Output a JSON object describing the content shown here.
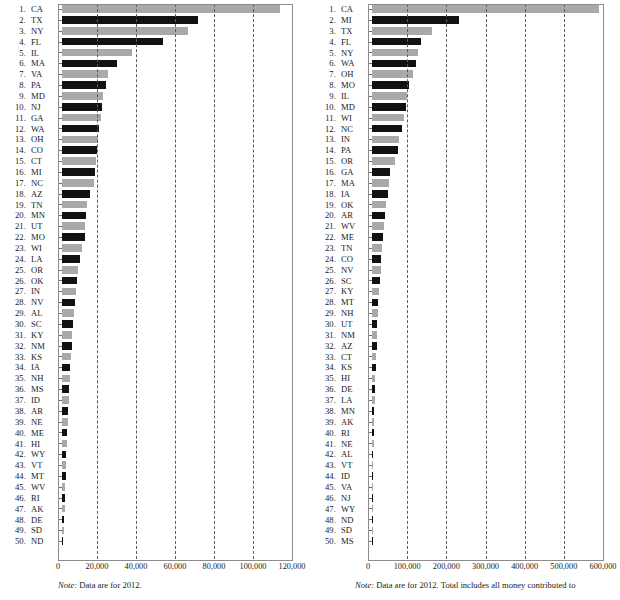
{
  "charts": [
    {
      "id": "left-chart",
      "note_prefix": "Note:",
      "note_text": " Data are for 2012.",
      "chart_data": {
        "type": "bar",
        "orientation": "horizontal",
        "title": "",
        "xlabel": "",
        "ylabel": "",
        "xlim": [
          0,
          120000
        ],
        "grid": true,
        "legend": false,
        "ticks": [
          "0",
          "20,000",
          "40,000",
          "60,000",
          "80,000",
          "100,000",
          "120,000"
        ],
        "tick_values": [
          0,
          20000,
          40000,
          60000,
          80000,
          100000,
          120000
        ],
        "categories": [
          "CA",
          "TX",
          "NY",
          "FL",
          "IL",
          "MA",
          "VA",
          "PA",
          "MD",
          "NJ",
          "GA",
          "WA",
          "OH",
          "CO",
          "CT",
          "MI",
          "NC",
          "AZ",
          "TN",
          "MN",
          "UT",
          "MO",
          "WI",
          "LA",
          "OR",
          "OK",
          "IN",
          "NV",
          "AL",
          "SC",
          "KY",
          "NM",
          "KS",
          "IA",
          "NH",
          "MS",
          "ID",
          "AR",
          "NE",
          "ME",
          "HI",
          "WY",
          "VT",
          "MT",
          "WV",
          "RI",
          "AK",
          "DE",
          "SD",
          "ND"
        ],
        "ranks": [
          1,
          2,
          3,
          4,
          5,
          6,
          7,
          8,
          9,
          10,
          11,
          12,
          13,
          14,
          15,
          16,
          17,
          18,
          19,
          20,
          21,
          22,
          23,
          24,
          25,
          26,
          27,
          28,
          29,
          30,
          31,
          32,
          33,
          34,
          35,
          36,
          37,
          38,
          39,
          40,
          41,
          42,
          43,
          44,
          45,
          46,
          47,
          48,
          49,
          50
        ],
        "values": [
          112000,
          69500,
          64500,
          52000,
          36000,
          28000,
          23500,
          22500,
          21000,
          20500,
          19800,
          19000,
          18500,
          17800,
          17200,
          17000,
          16200,
          14200,
          13000,
          12400,
          12000,
          11800,
          10200,
          9000,
          8400,
          7800,
          7200,
          6600,
          6200,
          5800,
          5200,
          4900,
          4600,
          4300,
          3900,
          3700,
          3400,
          3100,
          2900,
          2700,
          2500,
          2300,
          2100,
          1900,
          1700,
          1500,
          1300,
          1100,
          900,
          500
        ]
      }
    },
    {
      "id": "right-chart",
      "note_prefix": "Note:",
      "note_text": " Data are for 2012. Total includes all money contributed to",
      "chart_data": {
        "type": "bar",
        "orientation": "horizontal",
        "title": "",
        "xlabel": "",
        "ylabel": "",
        "xlim": [
          0,
          600000
        ],
        "grid": true,
        "legend": false,
        "ticks": [
          "0",
          "100,000",
          "200,000",
          "300,000",
          "400,000",
          "500,000",
          "600,000"
        ],
        "tick_values": [
          0,
          100000,
          200000,
          300000,
          400000,
          500000,
          600000
        ],
        "categories": [
          "CA",
          "MI",
          "TX",
          "FL",
          "NY",
          "WA",
          "OH",
          "MO",
          "IL",
          "MD",
          "WI",
          "NC",
          "IN",
          "PA",
          "OR",
          "GA",
          "MA",
          "IA",
          "OK",
          "AR",
          "WV",
          "ME",
          "TN",
          "CO",
          "NV",
          "SC",
          "KY",
          "MT",
          "NH",
          "UT",
          "NM",
          "AZ",
          "CT",
          "KS",
          "HI",
          "DE",
          "LA",
          "MN",
          "AK",
          "RI",
          "NE",
          "AL",
          "VT",
          "ID",
          "VA",
          "NJ",
          "WY",
          "ND",
          "SD",
          "MS"
        ],
        "ranks": [
          1,
          2,
          3,
          4,
          5,
          6,
          7,
          8,
          9,
          10,
          11,
          12,
          13,
          14,
          15,
          16,
          17,
          18,
          19,
          20,
          21,
          22,
          23,
          24,
          25,
          26,
          27,
          28,
          29,
          30,
          31,
          32,
          33,
          34,
          35,
          36,
          37,
          38,
          39,
          40,
          41,
          42,
          43,
          44,
          45,
          46,
          47,
          48,
          49,
          50
        ],
        "values": [
          580000,
          221000,
          152000,
          125000,
          118000,
          112000,
          105000,
          95000,
          90000,
          87000,
          82000,
          76000,
          70000,
          66000,
          58000,
          46000,
          43000,
          40000,
          36000,
          33000,
          30000,
          28000,
          26000,
          24000,
          22000,
          20000,
          18000,
          16500,
          15000,
          14000,
          12500,
          11500,
          10500,
          9500,
          8500,
          7500,
          6500,
          6000,
          5200,
          4500,
          4000,
          3500,
          3000,
          2600,
          2200,
          1800,
          1400,
          1000,
          700,
          400
        ]
      }
    }
  ]
}
